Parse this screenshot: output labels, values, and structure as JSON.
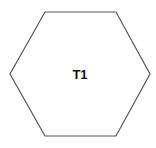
{
  "diagram": {
    "shape": "hexagon",
    "label": "T1",
    "stroke_color": "#555555",
    "fill_color": "#ffffff",
    "text_color": "#111111"
  }
}
